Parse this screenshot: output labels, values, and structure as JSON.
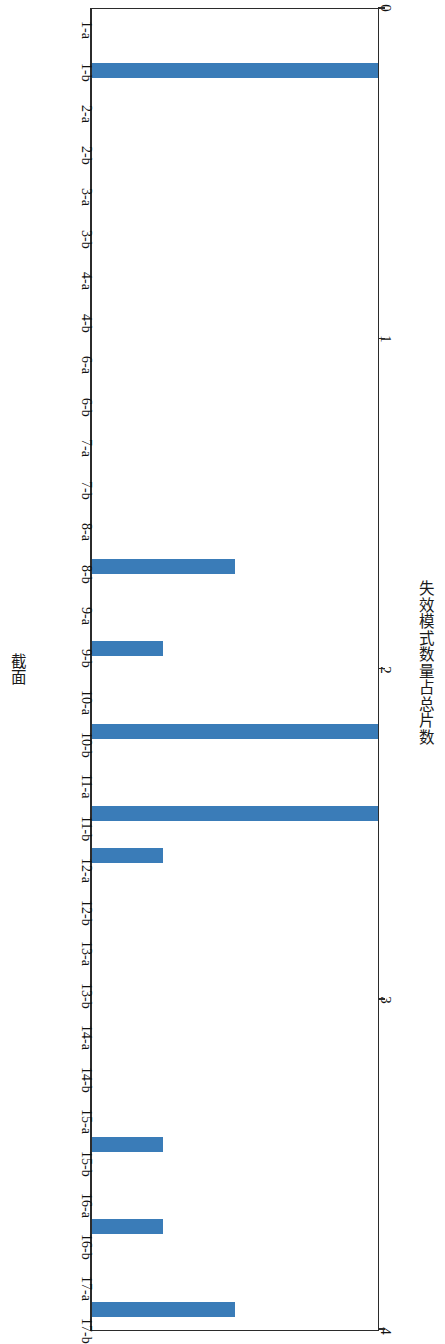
{
  "chart_data": {
    "type": "bar",
    "orientation": "horizontal",
    "title": "",
    "xlabel": "失效模式数量占总片数",
    "ylabel": "截面",
    "xlim": [
      0,
      4
    ],
    "xticks": [
      "0",
      "1",
      "2",
      "3",
      "4"
    ],
    "grid": false,
    "legend": null,
    "bar_color": "#3a7cb8",
    "axis_color": "#2b2b2b",
    "categories": [
      "1-a",
      "1-b",
      "2-a",
      "2-b",
      "3-a",
      "3-b",
      "4-a",
      "4-b",
      "6-a",
      "6-b",
      "7-a",
      "7-b",
      "8-a",
      "8-b",
      "9-a",
      "9-b",
      "10-a",
      "10-b",
      "11-a",
      "11-b",
      "12-a",
      "12-b",
      "13-a",
      "13-b",
      "14-a",
      "14-b",
      "15-a",
      "15-b",
      "16-a",
      "16-b",
      "17-a",
      "17-b"
    ],
    "values": [
      0,
      4,
      0,
      0,
      0,
      0,
      0,
      0,
      0,
      0,
      0,
      0,
      0,
      2,
      0,
      1,
      0,
      4,
      0,
      4,
      1,
      0,
      0,
      0,
      0,
      0,
      0,
      1,
      0,
      1,
      0,
      2
    ]
  }
}
